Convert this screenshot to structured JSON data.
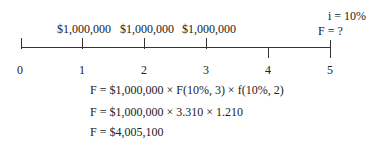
{
  "timeline": {
    "periods": [
      "0",
      "1",
      "2",
      "3",
      "4",
      "5"
    ],
    "amounts": [
      "$1,000,000",
      "$1,000,000",
      "$1,000,000"
    ],
    "interest": "i = 10%",
    "future": "F = ?"
  },
  "equations": [
    "F = $1,000,000 × F(10%, 3) × f(10%, 2)",
    "F = $1,000,000 × 3.310 × 1.210",
    "F = $4,005,100"
  ]
}
